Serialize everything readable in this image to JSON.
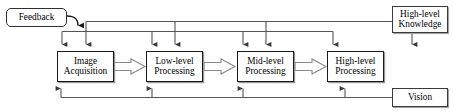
{
  "diagram": {
    "type": "block-flow-diagram",
    "colors": {
      "background": "#ffffff",
      "box_border": "#1a1a1a",
      "box_shadow": "#9a9a9a",
      "connector": "#555555",
      "block_arrow_fill": "#ffffff",
      "block_arrow_stroke": "#8a8a8a",
      "text": "#000000"
    },
    "nodes": [
      {
        "id": "feedback",
        "label": "Feedback",
        "lines": [
          "Feedback"
        ],
        "shape": "rounded-rect",
        "x": 6,
        "y": 8,
        "w": 61,
        "h": 19
      },
      {
        "id": "image-acquisition",
        "label": "Image Acquisition",
        "lines": [
          "Image",
          "Acquisition"
        ],
        "shape": "rect",
        "x": 57,
        "y": 51,
        "w": 57,
        "h": 31
      },
      {
        "id": "low-level-processing",
        "label": "Low-level Processing",
        "lines": [
          "Low-level",
          "Processing"
        ],
        "shape": "rect",
        "x": 146,
        "y": 51,
        "w": 57,
        "h": 31
      },
      {
        "id": "mid-level-processing",
        "label": "Mid-level Processing",
        "lines": [
          "Mid-level",
          "Processing"
        ],
        "shape": "rect",
        "x": 237,
        "y": 51,
        "w": 57,
        "h": 31
      },
      {
        "id": "high-level-processing",
        "label": "High-level Processing",
        "lines": [
          "High-level",
          "Processing"
        ],
        "shape": "rect",
        "x": 327,
        "y": 51,
        "w": 57,
        "h": 31
      },
      {
        "id": "high-level-knowledge",
        "label": "High-level Knowledge",
        "lines": [
          "High-level",
          "Knowledge"
        ],
        "shape": "rect",
        "x": 392,
        "y": 6,
        "w": 56,
        "h": 27
      },
      {
        "id": "vision",
        "label": "Vision",
        "lines": [
          "Vision"
        ],
        "shape": "rect",
        "x": 392,
        "y": 88,
        "w": 56,
        "h": 19
      }
    ],
    "flow_arrows": [
      {
        "from": "image-acquisition",
        "to": "low-level-processing",
        "style": "block"
      },
      {
        "from": "low-level-processing",
        "to": "mid-level-processing",
        "style": "block"
      },
      {
        "from": "mid-level-processing",
        "to": "high-level-processing",
        "style": "block"
      }
    ],
    "bus_connections": [
      {
        "id": "knowledge-bus-upper",
        "source": "high-level-knowledge",
        "targets": [
          "image-acquisition",
          "low-level-processing",
          "mid-level-processing",
          "high-level-processing"
        ],
        "direction": "down"
      },
      {
        "id": "knowledge-bus-lower",
        "source": "feedback",
        "targets": [
          "image-acquisition",
          "low-level-processing",
          "mid-level-processing"
        ],
        "direction": "down"
      },
      {
        "id": "vision-bus",
        "source": "vision",
        "targets": [
          "image-acquisition",
          "low-level-processing",
          "mid-level-processing",
          "high-level-processing"
        ],
        "direction": "up"
      }
    ]
  }
}
